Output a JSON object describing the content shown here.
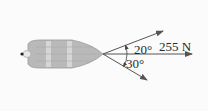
{
  "diagram": {
    "labels": {
      "angle_upper": "20°",
      "angle_lower": "30°",
      "resultant": "255 N"
    },
    "colors": {
      "boat_fill": "#b9b9b9",
      "boat_stripe": "#d9d9d9",
      "arrow": "#555555"
    }
  }
}
